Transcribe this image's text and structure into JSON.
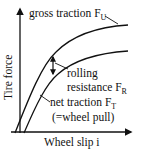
{
  "diagram": {
    "type": "tire traction vs. wheel slip",
    "colors": {
      "line": "#111111",
      "background": "#ffffff"
    },
    "axes": {
      "y_label": "Tire force",
      "x_label": "Wheel slip i"
    },
    "curves": [
      {
        "id": "gross",
        "label_main": "gross traction F",
        "label_sub": "U"
      },
      {
        "id": "net",
        "label_main": "net traction F",
        "label_sub": "T",
        "note": "(=wheel pull)"
      }
    ],
    "annotation": {
      "line1": "rolling",
      "line2_main": "resistance F",
      "line2_sub": "R"
    }
  }
}
